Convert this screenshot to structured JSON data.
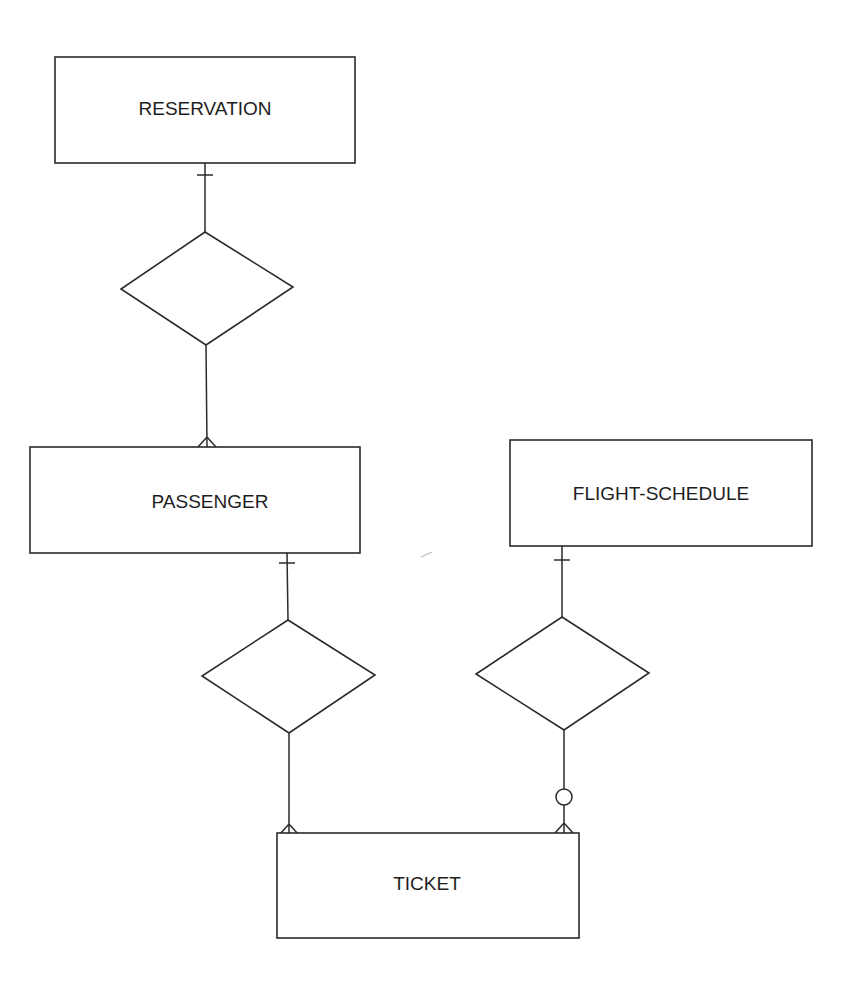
{
  "diagram": {
    "type": "entity-relationship",
    "notation": "crow's foot",
    "entities": [
      {
        "id": "reservation",
        "label": "RESERVATION"
      },
      {
        "id": "passenger",
        "label": "PASSENGER"
      },
      {
        "id": "flight_schedule",
        "label": "FLIGHT-SCHEDULE"
      },
      {
        "id": "ticket",
        "label": "TICKET"
      }
    ],
    "relationships": [
      {
        "id": "rel_reservation_passenger",
        "from": "RESERVATION",
        "to": "PASSENGER",
        "from_cardinality": "one",
        "to_cardinality": "many"
      },
      {
        "id": "rel_passenger_ticket",
        "from": "PASSENGER",
        "to": "TICKET",
        "from_cardinality": "one",
        "to_cardinality": "many"
      },
      {
        "id": "rel_flight_schedule_ticket",
        "from": "FLIGHT-SCHEDULE",
        "to": "TICKET",
        "from_cardinality": "one",
        "to_cardinality": "zero-or-many"
      }
    ]
  },
  "colors": {
    "line": "#2a2a2a",
    "text": "#1e1e1e",
    "background": "#ffffff"
  }
}
